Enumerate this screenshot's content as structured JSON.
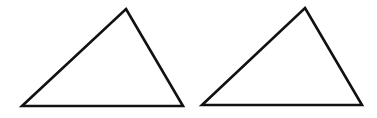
{
  "canvas": {
    "width": 377,
    "height": 118,
    "background": "#ffffff"
  },
  "style": {
    "stroke": "#111111",
    "stroke_width": 2.6,
    "fill": "#ffffff"
  },
  "shapes": [
    {
      "name": "left-triangle",
      "points": [
        [
          126,
          9
        ],
        [
          183,
          106
        ],
        [
          22,
          106
        ]
      ]
    },
    {
      "name": "right-triangle",
      "points": [
        [
          305,
          8
        ],
        [
          362,
          105
        ],
        [
          202,
          105
        ]
      ]
    }
  ]
}
